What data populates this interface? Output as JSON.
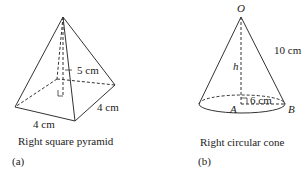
{
  "figure_a": {
    "height_label": "5 cm",
    "side_right_label": "4 cm",
    "side_front_label": "4 cm",
    "caption": "Right square pyramid",
    "tag": "(a)"
  },
  "figure_b": {
    "apex_label": "O",
    "slant_label": "10 cm",
    "height_label": "h",
    "radius_label": "6 cm",
    "center_label": "A",
    "edge_point_label": "B",
    "caption": "Right circular cone",
    "tag": "(b)"
  }
}
